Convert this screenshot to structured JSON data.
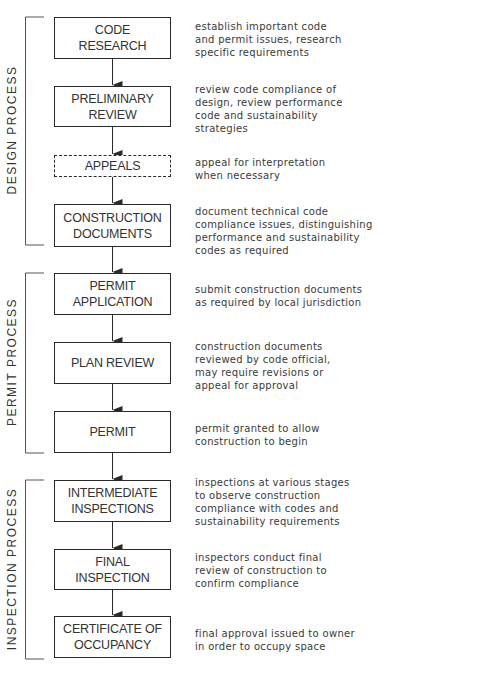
{
  "diagram": {
    "type": "process-flowchart",
    "colors": {
      "line": "#2a2a2a",
      "text": "#333333",
      "background": "#ffffff"
    },
    "sections": [
      {
        "id": "design",
        "label": "DESIGN PROCESS",
        "top": 17,
        "bottom": 245,
        "center": 130
      },
      {
        "id": "permit",
        "label": "PERMIT PROCESS",
        "top": 273,
        "bottom": 453,
        "center": 362
      },
      {
        "id": "inspection",
        "label": "INSPECTION PROCESS",
        "top": 480,
        "bottom": 659,
        "center": 569
      }
    ],
    "steps": [
      {
        "label": "CODE\nRESEARCH",
        "style": "solid",
        "top": 17,
        "height": 42,
        "description": "establish important code\nand permit issues, research\nspecific requirements",
        "desc_top": 20
      },
      {
        "label": "PRELIMINARY\nREVIEW",
        "style": "solid",
        "top": 86,
        "height": 41,
        "description": "review code compliance of\ndesign, review performance\ncode and sustainability\nstrategies",
        "desc_top": 83
      },
      {
        "label": "APPEALS",
        "style": "dashed",
        "top": 155,
        "height": 22,
        "description": "appeal for interpretation\nwhen necessary",
        "desc_top": 156
      },
      {
        "label": "CONSTRUCTION\nDOCUMENTS",
        "style": "solid",
        "top": 204,
        "height": 43,
        "description": "document technical code\ncompliance issues, distinguishing\nperformance and sustainability\ncodes as required",
        "desc_top": 205
      },
      {
        "label": "PERMIT\nAPPLICATION",
        "style": "solid",
        "top": 273,
        "height": 42,
        "description": "submit construction documents\nas required by local jurisdiction",
        "desc_top": 283
      },
      {
        "label": "PLAN REVIEW",
        "style": "solid",
        "top": 342,
        "height": 42,
        "description": "construction documents\nreviewed by code official,\nmay require revisions or\nappeal for approval",
        "desc_top": 340
      },
      {
        "label": "PERMIT",
        "style": "solid",
        "top": 411,
        "height": 42,
        "description": "permit granted to allow\nconstruction to begin",
        "desc_top": 422
      },
      {
        "label": "INTERMEDIATE\nINSPECTIONS",
        "style": "solid",
        "top": 480,
        "height": 42,
        "description": "inspections at various stages\nto observe construction\ncompliance with codes and\nsustainability requirements",
        "desc_top": 476
      },
      {
        "label": "FINAL\nINSPECTION",
        "style": "solid",
        "top": 549,
        "height": 41,
        "description": "inspectors conduct final\nreview of construction to\nconfirm compliance",
        "desc_top": 551
      },
      {
        "label": "CERTIFICATE OF\nOCCUPANCY",
        "style": "solid",
        "top": 616,
        "height": 42,
        "description": "final approval issued to owner\nin order to occupy space",
        "desc_top": 627
      }
    ]
  }
}
